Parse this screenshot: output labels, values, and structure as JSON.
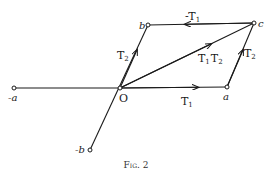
{
  "figure": {
    "caption": "Fig. 2",
    "points": {
      "O": {
        "label": "O",
        "x": 120,
        "y": 88
      },
      "a": {
        "label": "a",
        "x": 227,
        "y": 87
      },
      "neg_a": {
        "label": "-a",
        "x": 14,
        "y": 88
      },
      "b": {
        "label": "b",
        "x": 148,
        "y": 25
      },
      "neg_b": {
        "label": "-b",
        "x": 90,
        "y": 150
      },
      "c": {
        "label": "c",
        "x": 254,
        "y": 23
      }
    },
    "vectors": {
      "T1": {
        "label": "T",
        "sub": "1"
      },
      "T2_left": {
        "label": "T",
        "sub": "2"
      },
      "T2_right": {
        "label": "T",
        "sub": "2"
      },
      "neg_T1": {
        "label": "-T",
        "sub": "1"
      },
      "T1T2": {
        "label1": "T",
        "sub1": "1",
        "label2": "T",
        "sub2": "2"
      }
    },
    "colors": {
      "line": "#1a1a1a",
      "background": "#ffffff"
    }
  }
}
